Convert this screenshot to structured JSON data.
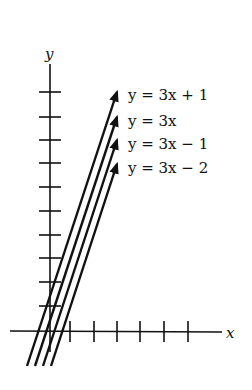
{
  "diagram": {
    "type": "coordinate-plane-lines",
    "axes": {
      "x_label": "x",
      "y_label": "y",
      "x_ticks": 6,
      "y_ticks": 8
    },
    "lines": [
      {
        "label": "y = 3x + 1",
        "slope": 3,
        "intercept": 1
      },
      {
        "label": "y = 3x",
        "slope": 3,
        "intercept": 0
      },
      {
        "label": "y = 3x − 1",
        "slope": 3,
        "intercept": -1
      },
      {
        "label": "y = 3x − 2",
        "slope": 3,
        "intercept": -2
      }
    ],
    "colors": {
      "ink": "#111111",
      "background": "#ffffff"
    }
  }
}
